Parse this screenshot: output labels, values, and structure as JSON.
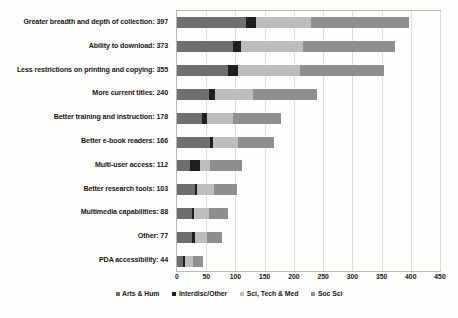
{
  "chart_data": {
    "type": "bar",
    "orientation": "horizontal",
    "stacked": true,
    "title": "",
    "xlabel": "",
    "ylabel": "",
    "xlim": [
      0,
      450
    ],
    "xticks": [
      0,
      50,
      100,
      150,
      200,
      250,
      300,
      350,
      400,
      450
    ],
    "grid": "vertical",
    "legend_position": "bottom",
    "categories": [
      "Greater breadth and depth of collection: 397",
      "Ability to download: 373",
      "Less restrictions on printing and copying: 355",
      "More current titles: 240",
      "Better training and instruction: 178",
      "Better e-book readers: 166",
      "Multi-user access: 112",
      "Better research tools: 103",
      "Multimedia capabilities: 88",
      "Other: 77",
      "PDA accessibility: 44"
    ],
    "category_names": [
      "Greater breadth and depth of collection",
      "Ability to download",
      "Less restrictions on printing and copying",
      "More current titles",
      "Better training and instruction",
      "Better e-book readers",
      "Multi-user access",
      "Better research tools",
      "Multimedia capabilities",
      "Other",
      "PDA accessibility"
    ],
    "totals": [
      397,
      373,
      355,
      240,
      178,
      166,
      112,
      103,
      88,
      77,
      44
    ],
    "series": [
      {
        "name": "Arts & Hum",
        "color": "#6e6e6e",
        "values": [
          118,
          95,
          88,
          55,
          43,
          57,
          23,
          30,
          25,
          26,
          10
        ]
      },
      {
        "name": "Interdisc/Other",
        "color": "#1f1f1f",
        "values": [
          17,
          15,
          17,
          10,
          9,
          4,
          17,
          4,
          4,
          4,
          3
        ]
      },
      {
        "name": "Sci, Tech & Med",
        "color": "#bdbdbd",
        "values": [
          95,
          105,
          105,
          65,
          43,
          43,
          17,
          30,
          25,
          22,
          14
        ]
      },
      {
        "name": "Soc Sci",
        "color": "#8f8f8f",
        "values": [
          167,
          158,
          145,
          110,
          83,
          62,
          55,
          39,
          34,
          25,
          17
        ]
      }
    ]
  }
}
